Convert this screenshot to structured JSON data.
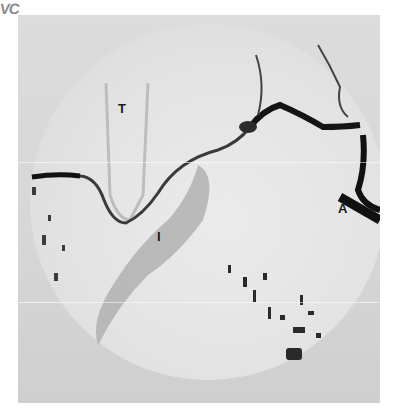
{
  "image": {
    "corner_label": "VC",
    "labels": {
      "t": "T",
      "i": "I",
      "a": "A"
    }
  },
  "colors": {
    "background": "#ffffff",
    "plate": "#d9d9d9",
    "vessel": "#1e1e1e",
    "label": "#1a1a1a"
  }
}
